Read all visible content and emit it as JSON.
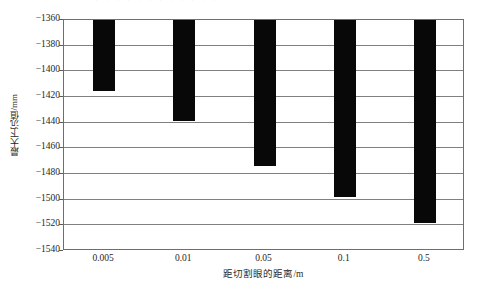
{
  "figure": {
    "top_caption_remnant": "· · ·   · · · ·   · ·   · · ·"
  },
  "chart_data": {
    "type": "bar",
    "title": "",
    "categories": [
      "0.005",
      "0.01",
      "0.05",
      "0.1",
      "0.5"
    ],
    "values": [
      -1415,
      -1439,
      -1474,
      -1498,
      -1518
    ],
    "baseline": -1360,
    "xlabel": "距切割眼的距离/m",
    "ylabel": "最大下沉值/mm",
    "ylim": [
      -1540,
      -1360
    ],
    "ytick_labels": [
      "-1360",
      "-1380",
      "-1400",
      "-1420",
      "-1440",
      "-1460",
      "-1480",
      "-1500",
      "-1520",
      "-1540"
    ],
    "ytick_values": [
      -1360,
      -1380,
      -1400,
      -1420,
      -1440,
      -1460,
      -1480,
      -1500,
      -1520,
      -1540
    ],
    "ytick_step": 20,
    "grid": true,
    "legend": "none",
    "bar_color": "#080808",
    "grid_color": "#808080",
    "frame_color": "#6e6e6e"
  }
}
